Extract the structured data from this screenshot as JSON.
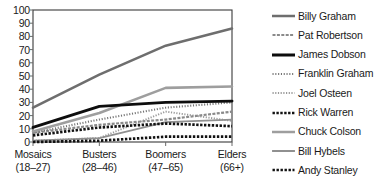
{
  "chart_data": {
    "type": "line",
    "title": "",
    "xlabel": "",
    "ylabel": "",
    "ylim": [
      0,
      100
    ],
    "ytick_step": 10,
    "yticks": [
      "100",
      "90",
      "80",
      "70",
      "60",
      "50",
      "40",
      "30",
      "20",
      "10",
      "0"
    ],
    "grid": false,
    "legend_position": "right",
    "categories": [
      "Mosaics",
      "Busters",
      "Boomers",
      "Elders"
    ],
    "category_ranges": [
      "(18–27)",
      "(28–46)",
      "(47–65)",
      "(66+)"
    ],
    "series": [
      {
        "name": "Billy Graham",
        "values": [
          26,
          51,
          73,
          86
        ],
        "color": "#6e6e6e",
        "width": 2.6,
        "dash": "",
        "style": "solid"
      },
      {
        "name": "Pat Robertson",
        "values": [
          7,
          13,
          17,
          23
        ],
        "color": "#8a8a8a",
        "width": 2.2,
        "dash": "3,1.4",
        "style": "dashed"
      },
      {
        "name": "James Dobson",
        "values": [
          11,
          27,
          30,
          31
        ],
        "color": "#0d0d0d",
        "width": 2.9,
        "dash": "",
        "style": "solid"
      },
      {
        "name": "Franklin Graham",
        "values": [
          7,
          17,
          26,
          30
        ],
        "color": "#757575",
        "width": 2.1,
        "dash": "1.1,1.7",
        "style": "dotted"
      },
      {
        "name": "Joel Osteen",
        "values": [
          1,
          3,
          23,
          16
        ],
        "color": "#9a9a9a",
        "width": 1.9,
        "dash": "1.2,1.5",
        "style": "dotted-fine"
      },
      {
        "name": "Rick Warren",
        "values": [
          5,
          11,
          14,
          12
        ],
        "color": "#121212",
        "width": 2.7,
        "dash": "2.4,1.5",
        "style": "dotted-bold"
      },
      {
        "name": "Chuck Colson",
        "values": [
          8,
          22,
          41,
          42
        ],
        "color": "#9e9e9e",
        "width": 2.6,
        "dash": "",
        "style": "solid"
      },
      {
        "name": "Bill Hybels",
        "values": [
          1,
          3,
          15,
          17
        ],
        "color": "#909090",
        "width": 1.8,
        "dash": "",
        "style": "solid-thin"
      },
      {
        "name": "Andy Stanley",
        "values": [
          0,
          1,
          4,
          4
        ],
        "color": "#121212",
        "width": 2.7,
        "dash": "2.4,1.6",
        "style": "dotted-bold"
      }
    ]
  },
  "axis": {
    "frame_color": "#3a3a3a",
    "tick_color": "#6a6a6a"
  }
}
